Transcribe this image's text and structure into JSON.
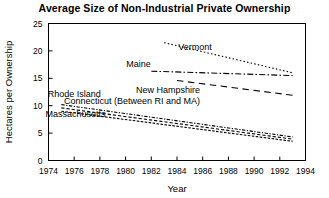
{
  "chart_data": {
    "type": "line",
    "title": "Average Size of Non-Industrial Private Ownership",
    "xlabel": "Year",
    "ylabel": "Hectares per Ownership",
    "xlim": [
      1974,
      1994
    ],
    "ylim": [
      0,
      25
    ],
    "xticks": [
      1974,
      1976,
      1978,
      1980,
      1982,
      1984,
      1986,
      1988,
      1990,
      1992,
      1994
    ],
    "yticks": [
      0,
      5,
      10,
      15,
      20,
      25
    ],
    "grid": false,
    "legend": "inline-annotations",
    "series": [
      {
        "name": "Vermont",
        "style": "dotted",
        "label_x": 1985.4,
        "label_y": 20.2,
        "x": [
          1983,
          1993
        ],
        "values": [
          21.5,
          16.0
        ]
      },
      {
        "name": "Maine",
        "style": "dash-dot",
        "label_x": 1981.0,
        "label_y": 17.1,
        "x": [
          1982,
          1993
        ],
        "values": [
          16.3,
          15.5
        ]
      },
      {
        "name": "New Hampshire",
        "style": "long-dash",
        "label_x": 1983.3,
        "label_y": 12.3,
        "x": [
          1984,
          1993
        ],
        "values": [
          14.6,
          11.9
        ]
      },
      {
        "name": "Rhode Island",
        "style": "dash-dot-tight",
        "label_x": 1976.0,
        "label_y": 11.6,
        "x": [
          1975,
          1993
        ],
        "values": [
          10.2,
          4.3
        ]
      },
      {
        "name": "Connecticut (Between RI and MA)",
        "style": "short-dash",
        "label_x": 1980.5,
        "label_y": 10.4,
        "x": [
          1975,
          1993
        ],
        "values": [
          9.6,
          3.9
        ]
      },
      {
        "name": "Massachusetts",
        "style": "solid-thin",
        "label_x": 1976.1,
        "label_y": 8.0,
        "x": [
          1975,
          1993
        ],
        "values": [
          9.0,
          3.5
        ]
      }
    ]
  }
}
